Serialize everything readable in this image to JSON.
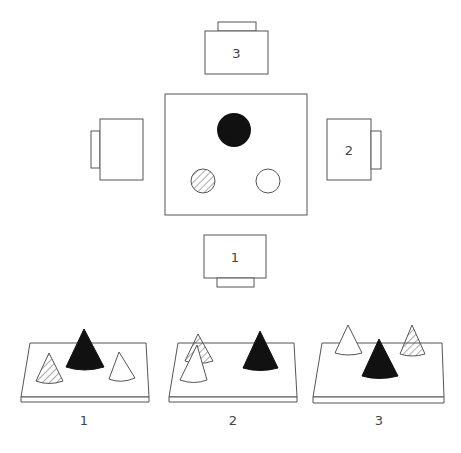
{
  "top_view": {
    "observers": [
      {
        "id": "observer-1",
        "label": "1",
        "position": "bottom"
      },
      {
        "id": "observer-2",
        "label": "2",
        "position": "right"
      },
      {
        "id": "observer-3",
        "label": "3",
        "position": "top"
      },
      {
        "id": "observer-4",
        "label": "",
        "position": "left"
      }
    ],
    "table_objects": [
      {
        "shape": "circle",
        "fill": "black",
        "position": "top-center"
      },
      {
        "shape": "circle",
        "fill": "hatched",
        "position": "bottom-left"
      },
      {
        "shape": "circle",
        "fill": "white",
        "position": "bottom-right"
      }
    ]
  },
  "perspective_views": [
    {
      "label": "1",
      "cones": [
        "hatched-left-front",
        "black-center-back",
        "white-right-front"
      ]
    },
    {
      "label": "2",
      "cones": [
        "hatched-left-back",
        "white-left-front",
        "black-right"
      ]
    },
    {
      "label": "3",
      "cones": [
        "white-left-back",
        "black-center-front",
        "hatched-right-back"
      ]
    }
  ],
  "colors": {
    "stroke": "#555555",
    "fill_black": "#111111",
    "background": "#ffffff"
  }
}
